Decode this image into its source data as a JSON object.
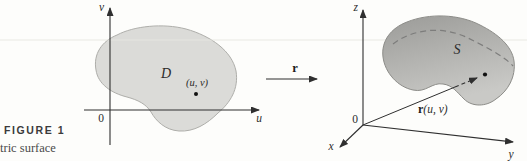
{
  "figure": {
    "label": "FIGURE 1",
    "caption": "tric surface"
  },
  "uv_plane": {
    "v_axis_label": "v",
    "u_axis_label": "u",
    "origin_label": "0",
    "region_label": "D",
    "point_label": "(u, v)"
  },
  "map": {
    "label": "r"
  },
  "xyz_space": {
    "z_axis_label": "z",
    "x_axis_label": "x",
    "y_axis_label": "y",
    "origin_label": "0",
    "surface_label": "S",
    "vector_label_r": "r",
    "vector_label_args": "(u, v)"
  },
  "colors": {
    "background": "#fdfdfb",
    "axis": "#2f2f2f",
    "region_fill": "#dbdbd8",
    "region_stroke": "#aeaeaa",
    "surface_fill_top": "#9b9b98",
    "surface_fill_bottom": "#c9c9c6",
    "surface_stroke": "#8c8c88",
    "dashed_curve": "#7d7d7c",
    "dot": "#111111",
    "rule_line": "#e8e8e1"
  }
}
